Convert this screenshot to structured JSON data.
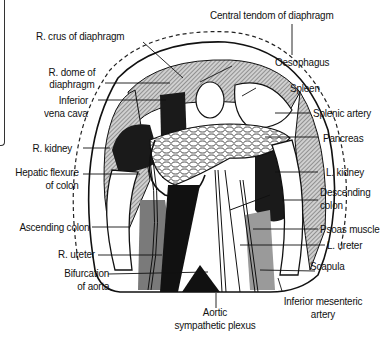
{
  "figure": {
    "labels": {
      "central_tendon": "Central tendom of diaphragm",
      "r_crus": "R. crus of diaphragm",
      "r_dome_1": "R. dome of",
      "r_dome_2": "diaphragm",
      "ivc_1": "Inferior",
      "ivc_2": "vena cava",
      "oesophagus": "Oesophagus",
      "spleen": "Spleen",
      "splenic_artery": "Splenic artery",
      "pancreas": "Pancreas",
      "r_kidney": "R. kidney",
      "hepatic_flexure_1": "Hepatic flexure",
      "hepatic_flexure_2": "of colon",
      "l_kidney": "L. kidney",
      "descending_colon_1": "Descending",
      "descending_colon_2": "colon",
      "ascending_colon": "Ascending colon",
      "psoas": "Psoas muscle",
      "l_ureter": "L. ureter",
      "r_ureter": "R. ureter",
      "scapula": "Scapula",
      "bifurcation_1": "Bifurcation",
      "bifurcation_2": "of aorta",
      "aortic_plexus_1": "Aortic",
      "aortic_plexus_2": "sympathetic plexus",
      "inf_mesenteric_1": "Inferior mesenteric",
      "inf_mesenteric_2": "artery"
    },
    "colors": {
      "ink": "#111111",
      "shade_dark": "#1a1a1a",
      "shade_mid": "#7a7a7a",
      "shade_light": "#b5b5b5",
      "paper": "#ffffff"
    }
  }
}
